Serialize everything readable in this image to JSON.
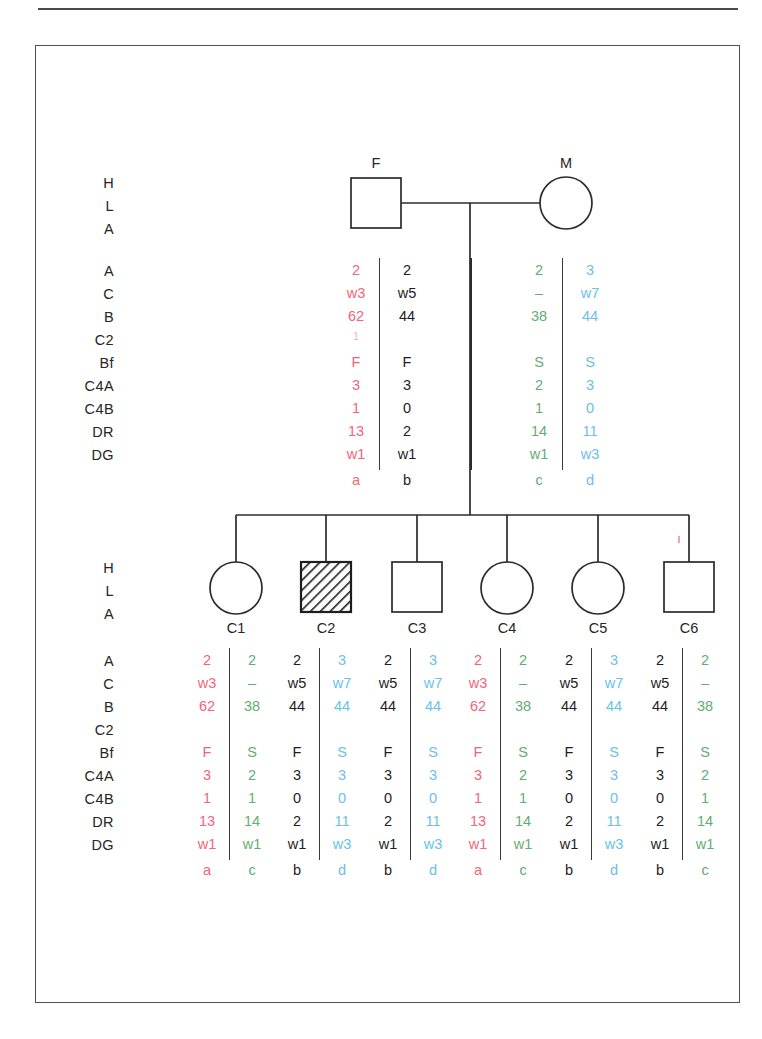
{
  "figure": {
    "type": "hla-haplotype-pedigree",
    "colors": {
      "haplotype_a": "#f2647a",
      "haplotype_b": "#1d1d1d",
      "haplotype_c": "#5fae72",
      "haplotype_d": "#69c1e8",
      "line": "#2b2b2b",
      "frame": "#4f4f4f"
    }
  },
  "row_labels": {
    "header": [
      "H",
      "L",
      "A"
    ],
    "loci": [
      "A",
      "C",
      "B",
      "C2",
      "Bf",
      "C4A",
      "C4B",
      "DR",
      "DG"
    ],
    "haplotype_row": ""
  },
  "parents": {
    "father": {
      "id": "F",
      "symbol": "square",
      "affected": false,
      "haplotypes": [
        {
          "name": "a",
          "color_key": "haplotype_a",
          "values": {
            "A": "2",
            "C": "w3",
            "B": "62",
            "C2": "1",
            "Bf": "F",
            "C4A": "3",
            "C4B": "1",
            "DR": "13",
            "DG": "w1"
          }
        },
        {
          "name": "b",
          "color_key": "haplotype_b",
          "values": {
            "A": "2",
            "C": "w5",
            "B": "44",
            "C2": "",
            "Bf": "F",
            "C4A": "3",
            "C4B": "0",
            "DR": "2",
            "DG": "w1"
          }
        }
      ]
    },
    "mother": {
      "id": "M",
      "symbol": "circle",
      "affected": false,
      "haplotypes": [
        {
          "name": "c",
          "color_key": "haplotype_c",
          "values": {
            "A": "2",
            "C": "–",
            "B": "38",
            "C2": "",
            "Bf": "S",
            "C4A": "2",
            "C4B": "1",
            "DR": "14",
            "DG": "w1"
          }
        },
        {
          "name": "d",
          "color_key": "haplotype_d",
          "values": {
            "A": "3",
            "C": "w7",
            "B": "44",
            "C2": "",
            "Bf": "S",
            "C4A": "3",
            "C4B": "0",
            "DR": "11",
            "DG": "w3"
          }
        }
      ]
    }
  },
  "children": [
    {
      "id": "C1",
      "symbol": "circle",
      "affected": false,
      "haplotypes": [
        {
          "name": "a",
          "color_key": "haplotype_a",
          "values": {
            "A": "2",
            "C": "w3",
            "B": "62",
            "C2": "",
            "Bf": "F",
            "C4A": "3",
            "C4B": "1",
            "DR": "13",
            "DG": "w1"
          }
        },
        {
          "name": "c",
          "color_key": "haplotype_c",
          "values": {
            "A": "2",
            "C": "–",
            "B": "38",
            "C2": "",
            "Bf": "S",
            "C4A": "2",
            "C4B": "1",
            "DR": "14",
            "DG": "w1"
          }
        }
      ]
    },
    {
      "id": "C2",
      "symbol": "square",
      "affected": true,
      "haplotypes": [
        {
          "name": "b",
          "color_key": "haplotype_b",
          "values": {
            "A": "2",
            "C": "w5",
            "B": "44",
            "C2": "",
            "Bf": "F",
            "C4A": "3",
            "C4B": "0",
            "DR": "2",
            "DG": "w1"
          }
        },
        {
          "name": "d",
          "color_key": "haplotype_d",
          "values": {
            "A": "3",
            "C": "w7",
            "B": "44",
            "C2": "",
            "Bf": "S",
            "C4A": "3",
            "C4B": "0",
            "DR": "11",
            "DG": "w3"
          }
        }
      ]
    },
    {
      "id": "C3",
      "symbol": "square",
      "affected": false,
      "haplotypes": [
        {
          "name": "b",
          "color_key": "haplotype_b",
          "values": {
            "A": "2",
            "C": "w5",
            "B": "44",
            "C2": "",
            "Bf": "F",
            "C4A": "3",
            "C4B": "0",
            "DR": "2",
            "DG": "w1"
          }
        },
        {
          "name": "d",
          "color_key": "haplotype_d",
          "values": {
            "A": "3",
            "C": "w7",
            "B": "44",
            "C2": "",
            "Bf": "S",
            "C4A": "3",
            "C4B": "0",
            "DR": "11",
            "DG": "w3"
          }
        }
      ]
    },
    {
      "id": "C4",
      "symbol": "circle",
      "affected": false,
      "haplotypes": [
        {
          "name": "a",
          "color_key": "haplotype_a",
          "values": {
            "A": "2",
            "C": "w3",
            "B": "62",
            "C2": "",
            "Bf": "F",
            "C4A": "3",
            "C4B": "1",
            "DR": "13",
            "DG": "w1"
          }
        },
        {
          "name": "c",
          "color_key": "haplotype_c",
          "values": {
            "A": "2",
            "C": "–",
            "B": "38",
            "C2": "",
            "Bf": "S",
            "C4A": "2",
            "C4B": "1",
            "DR": "14",
            "DG": "w1"
          }
        }
      ]
    },
    {
      "id": "C5",
      "symbol": "circle",
      "affected": false,
      "haplotypes": [
        {
          "name": "b",
          "color_key": "haplotype_b",
          "values": {
            "A": "2",
            "C": "w5",
            "B": "44",
            "C2": "",
            "Bf": "F",
            "C4A": "3",
            "C4B": "0",
            "DR": "2",
            "DG": "w1"
          }
        },
        {
          "name": "d",
          "color_key": "haplotype_d",
          "values": {
            "A": "3",
            "C": "w7",
            "B": "44",
            "C2": "",
            "Bf": "S",
            "C4A": "3",
            "C4B": "0",
            "DR": "11",
            "DG": "w3"
          }
        }
      ]
    },
    {
      "id": "C6",
      "symbol": "square",
      "affected": false,
      "haplotypes": [
        {
          "name": "b",
          "color_key": "haplotype_b",
          "values": {
            "A": "2",
            "C": "w5",
            "B": "44",
            "C2": "",
            "Bf": "F",
            "C4A": "3",
            "C4B": "0",
            "DR": "2",
            "DG": "w1"
          }
        },
        {
          "name": "c",
          "color_key": "haplotype_c",
          "values": {
            "A": "2",
            "C": "–",
            "B": "38",
            "C2": "",
            "Bf": "S",
            "C4A": "2",
            "C4B": "1",
            "DR": "14",
            "DG": "w1"
          }
        }
      ]
    }
  ]
}
